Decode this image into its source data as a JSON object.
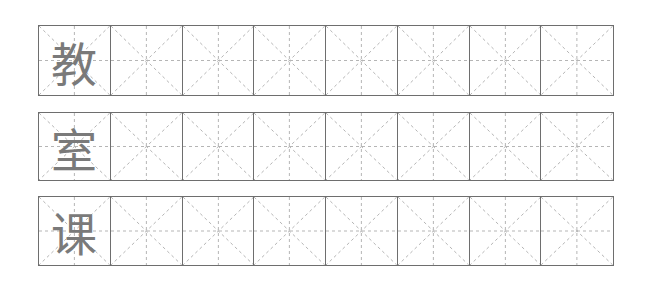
{
  "sheet": {
    "title": "",
    "rows": [
      {
        "character": "教",
        "empty_cells": 7
      },
      {
        "character": "室",
        "empty_cells": 7
      },
      {
        "character": "课",
        "empty_cells": 7
      }
    ],
    "grid_type": "mi-zi-ge",
    "colors": {
      "border": "#6e6e6e",
      "guide": "#b5b5b5",
      "character": "#7a7a7a"
    }
  }
}
